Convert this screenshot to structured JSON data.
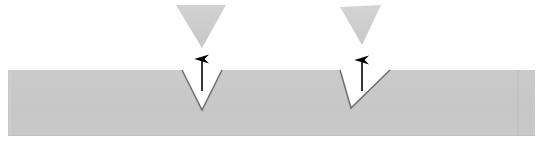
{
  "canvas": {
    "width": 543,
    "height": 151,
    "background": "#ffffff",
    "title": "V-notch indentation diagram"
  },
  "colors": {
    "material_fill": "#c8c8c8",
    "tool_fill": "#cccccc",
    "notch_edge": "#6e6e6e",
    "material_edge": "#c0c0c0",
    "arrow_stroke": "#000000",
    "seam_line": "#bcbcbc",
    "background": "#ffffff"
  },
  "material_slab": {
    "name": "workpiece-slab",
    "x": 8,
    "y": 70,
    "width": 527,
    "height": 66,
    "fill": "#c8c8c8",
    "top_surface_y": 70,
    "bottom_surface_y": 136,
    "left_edge_x": 8,
    "right_edge_x": 535,
    "seam_x": 518
  },
  "notches": [
    {
      "id": "notch-left",
      "label": "V-notch left",
      "opening_left_x": 182,
      "opening_right_x": 222,
      "opening_width": 40,
      "apex_x": 202,
      "apex_y": 110,
      "depth": 40,
      "surface_y": 70,
      "symmetric": true
    },
    {
      "id": "notch-right",
      "label": "V-notch right",
      "opening_left_x": 340,
      "opening_right_x": 390,
      "opening_width": 50,
      "apex_x": 351,
      "apex_y": 108,
      "depth": 38,
      "surface_y": 70,
      "symmetric": false
    }
  ],
  "indenters": [
    {
      "id": "indenter-left",
      "label": "Indenter tool left",
      "top_left_x": 176,
      "top_right_x": 226,
      "top_y": 5,
      "apex_x": 202,
      "apex_y": 48,
      "fill": "#cccccc",
      "symmetric": true
    },
    {
      "id": "indenter-right",
      "label": "Indenter tool right",
      "top_left_x": 340,
      "top_right_x": 381,
      "top_y": 7,
      "apex_x": 362,
      "apex_y": 45,
      "fill": "#cccccc",
      "symmetric": false
    }
  ],
  "arrows": [
    {
      "id": "arrow-left",
      "label": "Upward direction arrow left",
      "x": 202,
      "tail_y": 91,
      "head_y": 57,
      "direction": "up",
      "stroke": "#000000",
      "stroke_width": 1.6,
      "head_width": 8,
      "head_length": 9
    },
    {
      "id": "arrow-right",
      "label": "Upward direction arrow right",
      "x": 362,
      "tail_y": 91,
      "head_y": 58,
      "direction": "up",
      "stroke": "#000000",
      "stroke_width": 1.6,
      "head_width": 8,
      "head_length": 9
    }
  ],
  "legend": {
    "arrow_meaning": "Indentation / tool travel direction (upward)",
    "tool_meaning": "V-shaped indenter punch",
    "slab_meaning": "Sheet material cross-section"
  }
}
